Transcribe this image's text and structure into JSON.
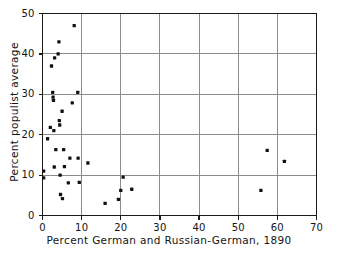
{
  "chart_data": {
    "type": "scatter",
    "title": "",
    "xlabel": "Percent German and Russian-German, 1890",
    "ylabel": "Percent populist average",
    "xlim": [
      0,
      70
    ],
    "ylim": [
      0,
      50
    ],
    "xticks": [
      0,
      10,
      20,
      30,
      40,
      50,
      60,
      70
    ],
    "yticks": [
      0,
      10,
      20,
      30,
      40,
      50
    ],
    "xtick_labels": [
      "0",
      "10",
      "20",
      "30",
      "40",
      "50",
      "60",
      "70"
    ],
    "ytick_labels": [
      "0",
      "10",
      "20",
      "30",
      "40",
      "50"
    ],
    "grid": true,
    "grid_style": "major gridlines at every labeled tick, thin gray",
    "legend": null,
    "marker": "square-dot",
    "marker_color": "#121212",
    "points": [
      {
        "x": 0.3,
        "y": 11.0
      },
      {
        "x": 0.3,
        "y": 9.3
      },
      {
        "x": 1.3,
        "y": 19.0
      },
      {
        "x": 2.0,
        "y": 21.8
      },
      {
        "x": 2.3,
        "y": 37.0
      },
      {
        "x": 2.6,
        "y": 30.5
      },
      {
        "x": 2.7,
        "y": 29.3
      },
      {
        "x": 2.8,
        "y": 28.5
      },
      {
        "x": 2.9,
        "y": 21.0
      },
      {
        "x": 3.0,
        "y": 12.0
      },
      {
        "x": 3.1,
        "y": 39.0
      },
      {
        "x": 3.4,
        "y": 16.3
      },
      {
        "x": 4.0,
        "y": 40.0
      },
      {
        "x": 4.2,
        "y": 43.0
      },
      {
        "x": 4.3,
        "y": 23.5
      },
      {
        "x": 4.4,
        "y": 22.4
      },
      {
        "x": 4.5,
        "y": 10.0
      },
      {
        "x": 4.6,
        "y": 5.2
      },
      {
        "x": 5.0,
        "y": 25.8
      },
      {
        "x": 5.1,
        "y": 4.2
      },
      {
        "x": 5.4,
        "y": 16.3
      },
      {
        "x": 5.6,
        "y": 12.1
      },
      {
        "x": 6.6,
        "y": 8.1
      },
      {
        "x": 7.0,
        "y": 14.2
      },
      {
        "x": 7.6,
        "y": 27.9
      },
      {
        "x": 8.1,
        "y": 47.0
      },
      {
        "x": 9.0,
        "y": 30.5
      },
      {
        "x": 9.1,
        "y": 14.2
      },
      {
        "x": 9.4,
        "y": 8.2
      },
      {
        "x": 11.6,
        "y": 13.0
      },
      {
        "x": 16.0,
        "y": 3.0
      },
      {
        "x": 19.4,
        "y": 4.0
      },
      {
        "x": 20.0,
        "y": 6.2
      },
      {
        "x": 20.6,
        "y": 9.5
      },
      {
        "x": 22.8,
        "y": 6.5
      },
      {
        "x": 55.8,
        "y": 6.2
      },
      {
        "x": 57.4,
        "y": 16.1
      },
      {
        "x": 61.8,
        "y": 13.4
      }
    ]
  }
}
